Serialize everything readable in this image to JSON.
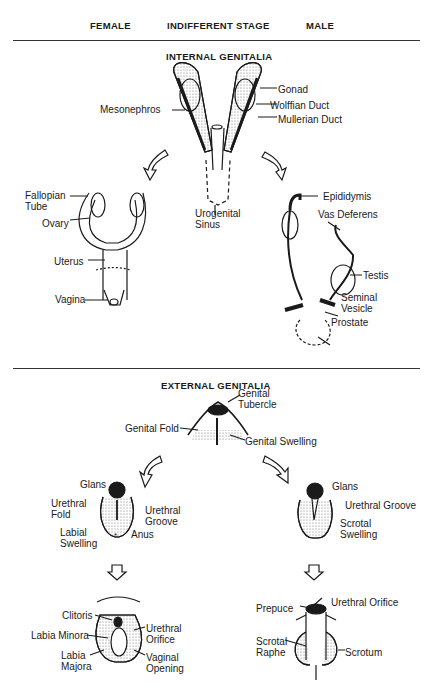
{
  "columns": {
    "female": "FEMALE",
    "indifferent": "INDIFFERENT STAGE",
    "male": "MALE"
  },
  "internal": {
    "title": "INTERNAL GENITALIA",
    "indifferent_labels": {
      "gonad": "Gonad",
      "mesonephros": "Mesonephros",
      "wolffian": "Wolffian Duct",
      "mullerian": "Mullerian Duct",
      "urogenital": "Urogenital\nSinus"
    },
    "female_labels": {
      "fallopian": "Fallopian\nTube",
      "ovary": "Ovary",
      "uterus": "Uterus",
      "vagina": "Vagina"
    },
    "male_labels": {
      "epididymis": "Epididymis",
      "vas": "Vas Deferens",
      "testis": "Testis",
      "seminal": "Seminal\nVesicle",
      "prostate": "Prostate"
    }
  },
  "external": {
    "title": "EXTERNAL GENITALIA",
    "indifferent_labels": {
      "tubercle": "Genital\nTubercle",
      "fold": "Genital Fold",
      "swelling": "Genital Swelling"
    },
    "female_mid_labels": {
      "glans": "Glans",
      "urethral_fold": "Urethral\nFold",
      "urethral_groove": "Urethral\nGroove",
      "labial_swelling": "Labial\nSwelling",
      "anus": "Anus"
    },
    "male_mid_labels": {
      "glans": "Glans",
      "urethral_groove": "Urethral Groove",
      "scrotal_swelling": "Scrotal\nSwelling"
    },
    "female_final_labels": {
      "clitoris": "Clitoris",
      "labia_minora": "Labia Minora",
      "labia_majora": "Labia\nMajora",
      "urethral_orifice": "Urethral\nOrifice",
      "vaginal_opening": "Vaginal\nOpening"
    },
    "male_final_labels": {
      "prepuce": "Prepuce",
      "urethral_orifice": "Urethral Orifice",
      "scrotal_raphe": "Scrotal\nRaphe",
      "scrotum": "Scrotum"
    }
  }
}
